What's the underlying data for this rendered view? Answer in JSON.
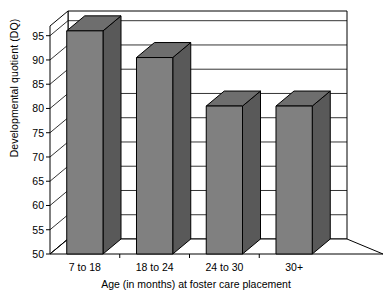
{
  "chart_data": {
    "type": "bar",
    "title": "",
    "subtitle": "",
    "xlabel": "Age (in months) at foster care placement",
    "ylabel": "Developmental quotient (DQ)",
    "categories": [
      "7 to 18",
      "18 to 24",
      "24 to 30",
      "30+"
    ],
    "values": [
      96,
      90.5,
      80.5,
      80.5
    ],
    "ylim": [
      50,
      97
    ],
    "yticks": [
      50,
      55,
      60,
      65,
      70,
      75,
      80,
      85,
      90,
      95
    ],
    "ytick_labels": [
      "50",
      "55",
      "60",
      "65",
      "70",
      "75",
      "80",
      "85",
      "90",
      "95"
    ],
    "grid": true,
    "legend": false,
    "legend_position": "none",
    "style": "3d-column",
    "series": [
      {
        "name": "Developmental quotient (DQ)",
        "values": [
          96,
          90.5,
          80.5,
          80.5
        ]
      }
    ],
    "annotations": []
  },
  "colors": {
    "bar_front": "#808080",
    "bar_side": "#595959",
    "bar_top": "#6e6e6e",
    "axis_line": "#000000",
    "grid_line": "#000000",
    "wall_fill": "#ffffff",
    "floor_fill": "#ffffff",
    "text": "#000000"
  }
}
